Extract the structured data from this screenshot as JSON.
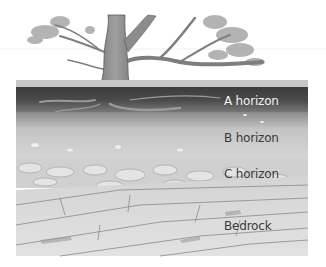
{
  "figure": {
    "labels": {
      "a_horizon": "A horizon",
      "b_horizon": "B horizon",
      "c_horizon": "C horizon",
      "bedrock": "Bedrock"
    }
  }
}
